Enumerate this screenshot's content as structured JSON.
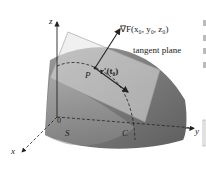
{
  "figure": {
    "labels": {
      "z_axis": "z",
      "y_axis": "y",
      "x_axis": "x",
      "origin": "0",
      "gradient": "∇F(x₀, y₀, z₀)",
      "tangent_plane": "tangent plane",
      "point": "P",
      "tangent_vector": "r′(t₀)",
      "surface": "S",
      "curve": "C"
    },
    "colors": {
      "surface_dark": "#6e6e6e",
      "surface_light": "#b5b5b5",
      "plane": "#d8d8d8",
      "axis": "#222222"
    }
  }
}
